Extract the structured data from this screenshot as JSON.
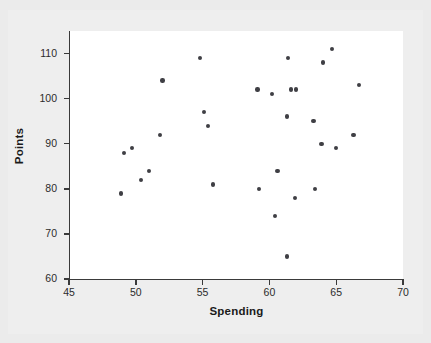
{
  "chart_data": {
    "type": "scatter",
    "title": "",
    "xlabel": "Spending",
    "ylabel": "Points",
    "xlim": [
      45,
      70
    ],
    "ylim": [
      60,
      115
    ],
    "xticks": [
      45,
      50,
      55,
      60,
      65,
      70
    ],
    "yticks": [
      60,
      70,
      80,
      90,
      100,
      110
    ],
    "grid": false,
    "legend": null,
    "marker": "filled-circle",
    "marker_color": "#3f3f44",
    "panel_background": "#ffffff",
    "figure_background": "#ebebeb",
    "axis_color": "#3a3a3a",
    "n_points": 32,
    "points": [
      {
        "x": 48.9,
        "y": 79
      },
      {
        "x": 49.1,
        "y": 88
      },
      {
        "x": 49.7,
        "y": 89
      },
      {
        "x": 50.4,
        "y": 82
      },
      {
        "x": 51.0,
        "y": 84
      },
      {
        "x": 51.8,
        "y": 92
      },
      {
        "x": 52.0,
        "y": 104
      },
      {
        "x": 54.8,
        "y": 109
      },
      {
        "x": 55.1,
        "y": 97
      },
      {
        "x": 55.4,
        "y": 94
      },
      {
        "x": 55.8,
        "y": 81
      },
      {
        "x": 59.1,
        "y": 102
      },
      {
        "x": 59.2,
        "y": 80
      },
      {
        "x": 60.2,
        "y": 101
      },
      {
        "x": 60.6,
        "y": 84
      },
      {
        "x": 60.4,
        "y": 74
      },
      {
        "x": 61.3,
        "y": 96
      },
      {
        "x": 61.4,
        "y": 109
      },
      {
        "x": 61.6,
        "y": 102
      },
      {
        "x": 62.0,
        "y": 102
      },
      {
        "x": 61.9,
        "y": 78
      },
      {
        "x": 61.3,
        "y": 65
      },
      {
        "x": 63.3,
        "y": 95
      },
      {
        "x": 63.4,
        "y": 80
      },
      {
        "x": 63.9,
        "y": 90
      },
      {
        "x": 64.0,
        "y": 108
      },
      {
        "x": 64.7,
        "y": 111
      },
      {
        "x": 65.0,
        "y": 89
      },
      {
        "x": 66.3,
        "y": 92
      },
      {
        "x": 66.7,
        "y": 103
      }
    ]
  },
  "axis": {
    "x_title": "Spending",
    "y_title": "Points",
    "x_tick_labels": [
      "45",
      "50",
      "55",
      "60",
      "65",
      "70"
    ],
    "y_tick_labels": [
      "60",
      "70",
      "80",
      "90",
      "100",
      "110"
    ]
  }
}
